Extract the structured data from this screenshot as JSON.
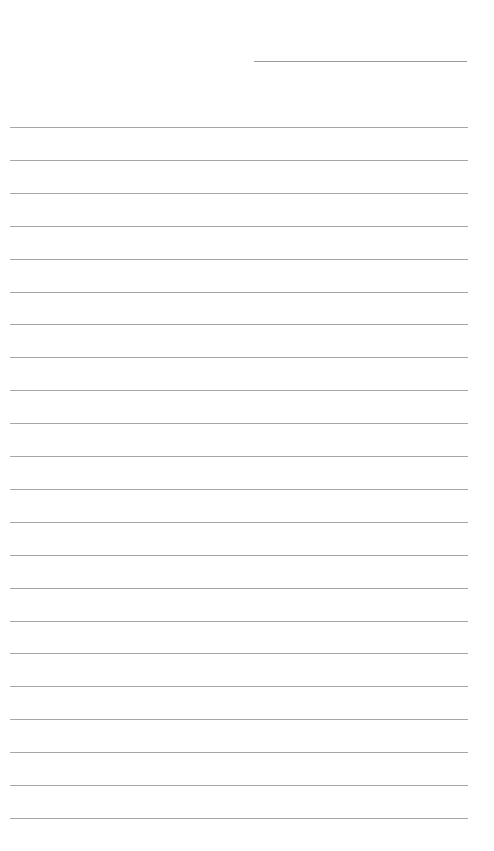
{
  "page": {
    "type": "lined-paper",
    "background": "#ffffff",
    "line_color": "#a6a6a6",
    "header_line": {
      "left": 254,
      "top": 61,
      "width": 213
    },
    "rules": {
      "count": 22,
      "left": 10,
      "width": 458,
      "first_top": 127,
      "spacing": 32.9
    }
  }
}
